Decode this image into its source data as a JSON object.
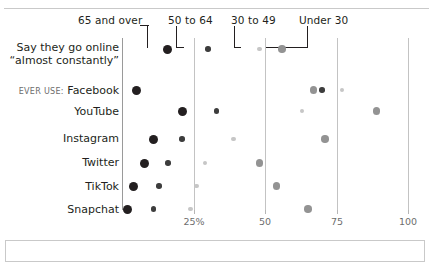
{
  "chart_data": {
    "type": "scatter",
    "title": "",
    "xlabel": "",
    "ylabel": "",
    "xlim": [
      0,
      100
    ],
    "grid": true,
    "gridlines": [
      0,
      25,
      50,
      75,
      100
    ],
    "legend_position": "top",
    "tick_labels": [
      "25%",
      "50",
      "75",
      "100"
    ],
    "tick_values": [
      25,
      50,
      75,
      100
    ],
    "series": [
      {
        "name": "65 and over",
        "color": "#231f20",
        "size": "large",
        "values": [
          16,
          5,
          21,
          11,
          8,
          4,
          2
        ]
      },
      {
        "name": "50 to 64",
        "color": "#3d3d3d",
        "size": "small",
        "values": [
          30,
          70,
          33,
          21,
          16,
          13,
          11
        ]
      },
      {
        "name": "30 to 49",
        "color": "#c6c6c6",
        "size": "xsmall",
        "values": [
          48,
          77,
          63,
          39,
          29,
          26,
          24
        ]
      },
      {
        "name": "Under 30",
        "color": "#939393",
        "size": "medium",
        "values": [
          56,
          67,
          89,
          71,
          48,
          54,
          65
        ]
      }
    ],
    "categories": [
      "Say they go online “almost constantly”",
      "Facebook",
      "YouTube",
      "Instagram",
      "Twitter",
      "TikTok",
      "Snapchat"
    ]
  },
  "legend": {
    "items": [
      {
        "label": "65 and over"
      },
      {
        "label": "50 to 64"
      },
      {
        "label": "30 to 49"
      },
      {
        "label": "Under 30"
      }
    ]
  },
  "rows": [
    {
      "label_line1": "Say they go online",
      "label_line2": "“almost constantly”",
      "prefix": ""
    },
    {
      "label_line1": "Facebook",
      "label_line2": "",
      "prefix": "EVER USE:"
    },
    {
      "label_line1": "YouTube",
      "label_line2": "",
      "prefix": ""
    },
    {
      "label_line1": "Instagram",
      "label_line2": "",
      "prefix": ""
    },
    {
      "label_line1": "Twitter",
      "label_line2": "",
      "prefix": ""
    },
    {
      "label_line1": "TikTok",
      "label_line2": "",
      "prefix": ""
    },
    {
      "label_line1": "Snapchat",
      "label_line2": "",
      "prefix": ""
    }
  ],
  "axis": {
    "ticks": [
      {
        "label": "25%"
      },
      {
        "label": "50"
      },
      {
        "label": "75"
      },
      {
        "label": "100"
      }
    ]
  }
}
